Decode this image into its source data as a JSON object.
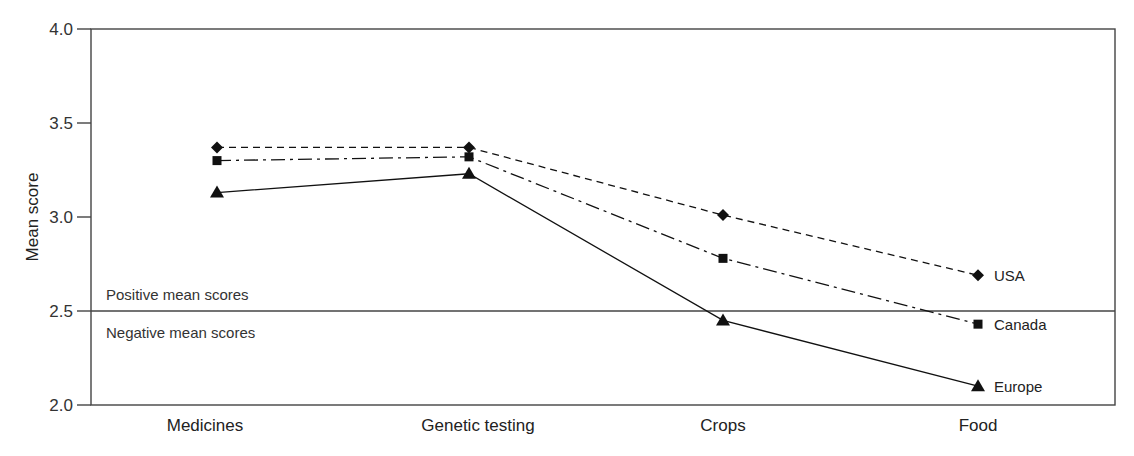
{
  "chart_data": {
    "type": "line",
    "title": "",
    "xlabel": "",
    "ylabel": "Mean score",
    "ylim": [
      2.0,
      4.0
    ],
    "yticks": [
      2.0,
      2.5,
      3.0,
      3.5,
      4.0
    ],
    "ytick_labels": [
      "2.0",
      "2.5",
      "3.0",
      "3.5",
      "4.0"
    ],
    "grid": false,
    "categories": [
      "Medicines",
      "Genetic testing",
      "Crops",
      "Food"
    ],
    "series": [
      {
        "name": "USA",
        "marker": "diamond",
        "line_style": "dashed",
        "values": [
          3.37,
          3.37,
          3.01,
          2.69
        ]
      },
      {
        "name": "Canada",
        "marker": "square",
        "line_style": "dash-dot",
        "values": [
          3.3,
          3.32,
          2.78,
          2.43
        ]
      },
      {
        "name": "Europe",
        "marker": "triangle",
        "line_style": "solid",
        "values": [
          3.13,
          3.23,
          2.45,
          2.1
        ]
      }
    ],
    "reference_line": {
      "y": 2.5,
      "label_above": "Positive mean scores",
      "label_below": "Negative mean scores"
    },
    "legend_position": "inline-right (labels at last point)"
  },
  "colors": {
    "line": "#111111",
    "frame": "#444444",
    "text": "#222222",
    "background": "#ffffff"
  }
}
